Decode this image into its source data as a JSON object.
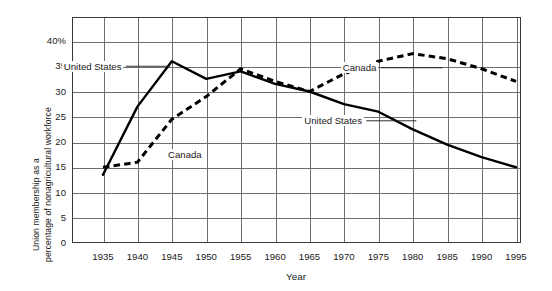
{
  "chart_data": {
    "type": "line",
    "title": "",
    "xlabel": "Year",
    "ylabel_line1": "Union membership as a",
    "ylabel_line2": "percentage of nonagricultural workforce",
    "x": [
      1935,
      1940,
      1945,
      1950,
      1955,
      1960,
      1965,
      1970,
      1975,
      1980,
      1985,
      1990,
      1995
    ],
    "xlim": [
      1933,
      1997
    ],
    "ylim": [
      0,
      44
    ],
    "xticks": [
      "1935",
      "1940",
      "1945",
      "1950",
      "1955",
      "1960",
      "1965",
      "1970",
      "1975",
      "1980",
      "1985",
      "1990",
      "1995"
    ],
    "yticks": [
      "0",
      "5",
      "10",
      "15",
      "20",
      "25",
      "30",
      "35",
      "40%"
    ],
    "ytick_values": [
      0,
      5,
      10,
      15,
      20,
      25,
      30,
      35,
      40
    ],
    "grid": "both",
    "legend_position": "inline-labels",
    "series": [
      {
        "name": "United States",
        "style": "solid",
        "color": "#000000",
        "values": [
          13.5,
          27.0,
          36.0,
          32.5,
          34.0,
          31.5,
          30.0,
          27.5,
          26.0,
          22.5,
          19.5,
          17.0,
          15.0
        ]
      },
      {
        "name": "Canada",
        "style": "dashed",
        "color": "#000000",
        "values": [
          15.0,
          16.0,
          24.5,
          29.0,
          34.5,
          32.0,
          30.0,
          33.5,
          36.0,
          37.5,
          36.5,
          34.5,
          32.0
        ]
      }
    ],
    "annotations": [
      {
        "text": "United States",
        "ref_year": 1945,
        "ref_value": 35.0,
        "placement": "upper-left"
      },
      {
        "text": "Canada",
        "ref_year": 1943,
        "ref_value": 17.5,
        "placement": "lower-left"
      },
      {
        "text": "Canada",
        "ref_year": 1980,
        "ref_value": 34.7,
        "placement": "upper-right"
      },
      {
        "text": "United States",
        "ref_year": 1975,
        "ref_value": 24.2,
        "placement": "lower-right"
      }
    ]
  },
  "caption": {
    "clipped_text": ""
  }
}
